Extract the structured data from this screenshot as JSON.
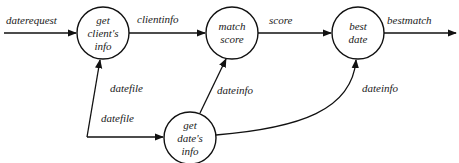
{
  "diagram": {
    "type": "data-flow-diagram",
    "nodes": [
      {
        "id": "get-clients-info",
        "lines": [
          "get",
          "client's",
          "info"
        ],
        "cx": 103,
        "cy": 33,
        "r": 26
      },
      {
        "id": "match-score",
        "lines": [
          "match",
          "score"
        ],
        "cx": 232,
        "cy": 33,
        "r": 26
      },
      {
        "id": "best-date",
        "lines": [
          "best",
          "date"
        ],
        "cx": 358,
        "cy": 33,
        "r": 26
      },
      {
        "id": "get-dates-info",
        "lines": [
          "get",
          "date's",
          "info"
        ],
        "cx": 190,
        "cy": 138,
        "r": 26
      }
    ],
    "edges": [
      {
        "id": "daterequest",
        "label": "daterequest",
        "from": "external",
        "to": "get-clients-info"
      },
      {
        "id": "clientinfo",
        "label": "clientinfo",
        "from": "get-clients-info",
        "to": "match-score"
      },
      {
        "id": "score",
        "label": "score",
        "from": "match-score",
        "to": "best-date"
      },
      {
        "id": "bestmatch",
        "label": "bestmatch",
        "from": "best-date",
        "to": "external"
      },
      {
        "id": "datefile-to-client",
        "label": "datefile",
        "from": "datefile-source",
        "to": "get-clients-info"
      },
      {
        "id": "datefile-to-date",
        "label": "datefile",
        "from": "datefile-source",
        "to": "get-dates-info"
      },
      {
        "id": "dateinfo-to-match",
        "label": "dateinfo",
        "from": "get-dates-info",
        "to": "match-score"
      },
      {
        "id": "dateinfo-to-best",
        "label": "dateinfo",
        "from": "get-dates-info",
        "to": "best-date"
      }
    ]
  },
  "colors": {
    "stroke": "#111111",
    "text": "#1a1a1a",
    "background": "#ffffff"
  }
}
